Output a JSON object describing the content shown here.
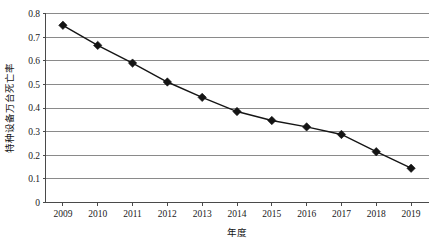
{
  "chart_data": {
    "type": "line",
    "title": "",
    "xlabel": "年度",
    "ylabel": "特种设备万台死亡率",
    "categories": [
      "2009",
      "2010",
      "2011",
      "2012",
      "2013",
      "2014",
      "2015",
      "2016",
      "2017",
      "2018",
      "2019"
    ],
    "values": [
      0.75,
      0.665,
      0.59,
      0.51,
      0.445,
      0.385,
      0.347,
      0.32,
      0.288,
      0.215,
      0.145
    ],
    "series": [
      {
        "name": "特种设备万台死亡率",
        "values": [
          0.75,
          0.665,
          0.59,
          0.51,
          0.445,
          0.385,
          0.347,
          0.32,
          0.288,
          0.215,
          0.145
        ]
      }
    ],
    "ylim": [
      0,
      0.8
    ],
    "y_ticks": [
      "0",
      "0.1",
      "0.2",
      "0.3",
      "0.4",
      "0.5",
      "0.6",
      "0.7",
      "0.8"
    ],
    "y_tick_values": [
      0,
      0.1,
      0.2,
      0.3,
      0.4,
      0.5,
      0.6,
      0.7,
      0.8
    ],
    "x_ticks": [
      "2009",
      "2010",
      "2011",
      "2012",
      "2013",
      "2014",
      "2015",
      "2016",
      "2017",
      "2018",
      "2019"
    ],
    "grid": "horizontal",
    "legend": "none",
    "marker": "diamond",
    "line_color": "#151515",
    "marker_color": "#141414",
    "grid_color": "#8a8a8a",
    "axis_color": "#4a4a4a",
    "background": "#ffffff"
  }
}
